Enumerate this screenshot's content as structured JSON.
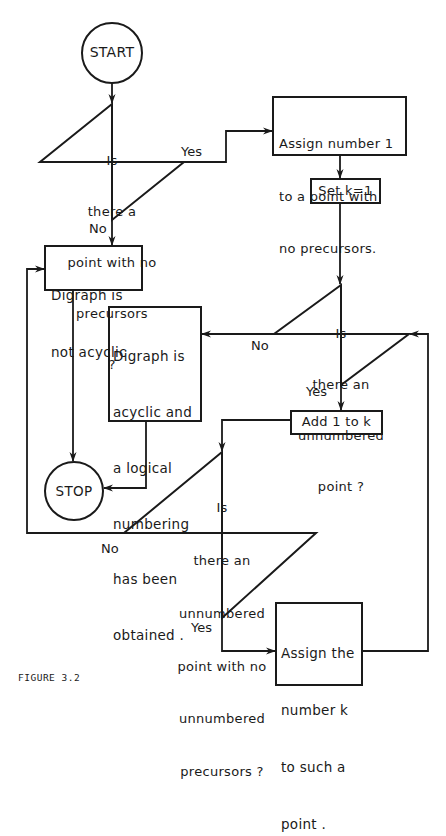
{
  "figure": {
    "caption": "FIGURE 3.2",
    "stroke_color": "#1a1a1a",
    "background": "#ffffff"
  },
  "nodes": {
    "start": {
      "type": "terminal",
      "label": "START"
    },
    "decision1": {
      "type": "decision",
      "lines": [
        "Is",
        "there a",
        "point with no",
        "precursors",
        "?"
      ]
    },
    "assign1": {
      "type": "process",
      "lines": [
        "Assign number 1",
        "to a point with",
        "no precursors."
      ]
    },
    "setk": {
      "type": "process",
      "label": "Set k=1"
    },
    "not_acyclic": {
      "type": "process",
      "lines": [
        "Digraph is",
        "not acyclic"
      ]
    },
    "decision2": {
      "type": "decision",
      "lines": [
        "Is",
        "there an",
        "unnumbered",
        "point ?"
      ]
    },
    "acyclic": {
      "type": "process",
      "lines": [
        "Digraph is",
        "acyclic and",
        "a logical",
        "numbering",
        "has been",
        "obtained ."
      ]
    },
    "addk": {
      "type": "process",
      "label": "Add 1 to k"
    },
    "stop": {
      "type": "terminal",
      "label": "STOP"
    },
    "decision3": {
      "type": "decision",
      "lines": [
        "Is",
        "there an",
        "unnumbered",
        "point with no",
        "unnumbered",
        "precursors ?"
      ]
    },
    "assignk": {
      "type": "process",
      "lines": [
        "Assign the",
        "number k",
        "to such a",
        "point ."
      ]
    }
  },
  "edges": {
    "d1_yes": "Yes",
    "d1_no": "No",
    "d2_no": "No",
    "d2_yes": "Yes",
    "d3_no": "No",
    "d3_yes": "Yes"
  }
}
